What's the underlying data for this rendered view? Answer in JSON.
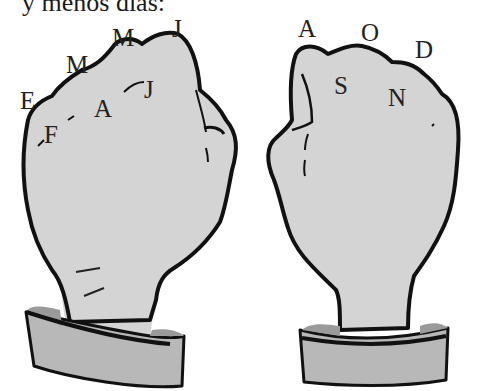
{
  "caption": "y menos días:",
  "left_fist": {
    "description": "Left fist, knuckles and gaps labeled with month initials",
    "labels": [
      {
        "id": "e",
        "text": "E",
        "x": 22,
        "y": 87
      },
      {
        "id": "f",
        "text": "F",
        "x": 44,
        "y": 123
      },
      {
        "id": "m1",
        "text": "M",
        "x": 68,
        "y": 52
      },
      {
        "id": "a",
        "text": "A",
        "x": 94,
        "y": 97
      },
      {
        "id": "m2",
        "text": "M",
        "x": 112,
        "y": 25
      },
      {
        "id": "j1",
        "text": "J",
        "x": 145,
        "y": 77
      },
      {
        "id": "j2",
        "text": "J",
        "x": 172,
        "y": 16
      }
    ]
  },
  "right_fist": {
    "description": "Right fist, knuckles and gaps labeled with month initials",
    "labels": [
      {
        "id": "a",
        "text": "A",
        "x": 298,
        "y": 16
      },
      {
        "id": "s",
        "text": "S",
        "x": 334,
        "y": 73
      },
      {
        "id": "o",
        "text": "O",
        "x": 362,
        "y": 20
      },
      {
        "id": "n",
        "text": "N",
        "x": 389,
        "y": 85
      },
      {
        "id": "d",
        "text": "D",
        "x": 415,
        "y": 37
      }
    ]
  },
  "colors": {
    "skin": "#d4d4d4",
    "cuff": "#b8b8b8",
    "cuff_inner": "#9a9a9a",
    "outline": "#111111",
    "text": "#222222"
  }
}
